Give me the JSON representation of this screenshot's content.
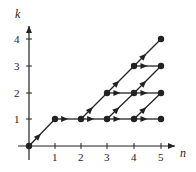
{
  "diagram": {
    "x_axis_label": "n",
    "y_axis_label": "k",
    "x_ticks": [
      "1",
      "2",
      "3",
      "4",
      "5"
    ],
    "y_ticks": [
      "1",
      "2",
      "3",
      "4"
    ],
    "colors": {
      "ink": "#222222",
      "background": "#ffffff"
    },
    "nodes": [
      [
        0,
        0
      ],
      [
        1,
        1
      ],
      [
        2,
        1
      ],
      [
        3,
        1
      ],
      [
        3,
        2
      ],
      [
        4,
        1
      ],
      [
        4,
        2
      ],
      [
        4,
        3
      ],
      [
        5,
        1
      ],
      [
        5,
        2
      ],
      [
        5,
        3
      ],
      [
        5,
        4
      ]
    ],
    "edges": [
      {
        "from": [
          0,
          0
        ],
        "to": [
          1,
          1
        ],
        "type": "diagonal"
      },
      {
        "from": [
          1,
          1
        ],
        "to": [
          2,
          1
        ],
        "type": "horizontal"
      },
      {
        "from": [
          2,
          1
        ],
        "to": [
          3,
          1
        ],
        "type": "horizontal"
      },
      {
        "from": [
          2,
          1
        ],
        "to": [
          3,
          2
        ],
        "type": "diagonal"
      },
      {
        "from": [
          3,
          1
        ],
        "to": [
          4,
          1
        ],
        "type": "horizontal"
      },
      {
        "from": [
          3,
          1
        ],
        "to": [
          4,
          2
        ],
        "type": "diagonal"
      },
      {
        "from": [
          3,
          2
        ],
        "to": [
          4,
          2
        ],
        "type": "horizontal"
      },
      {
        "from": [
          3,
          2
        ],
        "to": [
          4,
          3
        ],
        "type": "diagonal"
      },
      {
        "from": [
          4,
          1
        ],
        "to": [
          5,
          1
        ],
        "type": "horizontal"
      },
      {
        "from": [
          4,
          1
        ],
        "to": [
          5,
          2
        ],
        "type": "diagonal"
      },
      {
        "from": [
          4,
          2
        ],
        "to": [
          5,
          2
        ],
        "type": "horizontal"
      },
      {
        "from": [
          4,
          2
        ],
        "to": [
          5,
          3
        ],
        "type": "diagonal"
      },
      {
        "from": [
          4,
          3
        ],
        "to": [
          5,
          3
        ],
        "type": "horizontal"
      },
      {
        "from": [
          4,
          3
        ],
        "to": [
          5,
          4
        ],
        "type": "diagonal"
      }
    ]
  }
}
